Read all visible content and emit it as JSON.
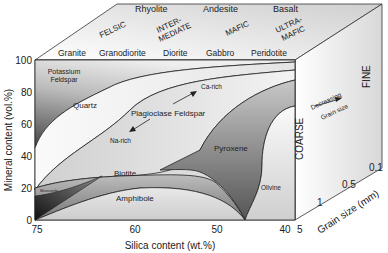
{
  "top_face": {
    "volcanic": [
      "Rhyolite",
      "Andesite",
      "Basalt"
    ],
    "categories": [
      "FELSIC",
      "INTER-",
      "MEDIATE",
      "MAFIC",
      "ULTRA-",
      "MAFIC"
    ],
    "plutonic": [
      "Granite",
      "Granodiorite",
      "Diorite",
      "Gabbro",
      "Peridotite"
    ]
  },
  "front_face": {
    "y_axis_label": "Mineral content (vol.%)",
    "y_ticks": [
      "100",
      "80",
      "60",
      "40",
      "20",
      "0"
    ],
    "x_axis_label": "Silica content (wt.%)",
    "x_ticks": [
      "75",
      "60",
      "50",
      "40"
    ],
    "minerals": {
      "k_feldspar_1": "Potassium",
      "k_feldspar_2": "Feldspar",
      "quartz": "Quartz",
      "plagioclase": "Plagioclase Feldspar",
      "ca_rich": "Ca-rich",
      "na_rich": "Na-rich",
      "pyroxene": "Pyroxene",
      "biotite": "Biotite",
      "muscovite": "Muscovite",
      "amphibole": "Amphibole",
      "olivine": "Olivine"
    }
  },
  "side_face": {
    "coarse": "COARSE",
    "fine": "FINE",
    "decreasing": "Decreasing",
    "grain_size": "Grain size",
    "z_axis_label": "Grain size (mm)",
    "z_ticks": [
      "5",
      "1",
      "0.5",
      "0.1"
    ]
  }
}
